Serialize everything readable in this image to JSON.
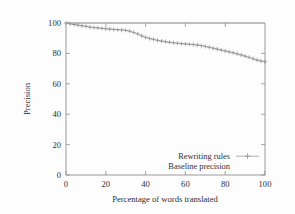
{
  "chart_data": {
    "type": "line",
    "title": "",
    "xlabel": "Percentage of words translated",
    "ylabel": "Precision",
    "xlim": [
      0,
      100
    ],
    "ylim": [
      0,
      100
    ],
    "xticks": [
      0,
      20,
      40,
      60,
      80,
      100
    ],
    "yticks": [
      0,
      20,
      40,
      60,
      80,
      100
    ],
    "grid": false,
    "legend_position": "inside-bottom-right",
    "legend": [
      "Rewriting rules",
      "Baseline precision"
    ],
    "series": [
      {
        "name": "Rewriting rules",
        "marker": "plus",
        "x": [
          0,
          2,
          4,
          6,
          8,
          10,
          12,
          14,
          16,
          18,
          20,
          22,
          24,
          26,
          28,
          30,
          32,
          34,
          36,
          38,
          40,
          42,
          44,
          46,
          48,
          50,
          52,
          54,
          56,
          58,
          60,
          62,
          64,
          66,
          68,
          70,
          72,
          74,
          76,
          78,
          80,
          82,
          84,
          86,
          88,
          90,
          92,
          94,
          96,
          98,
          100
        ],
        "values": [
          100,
          99.5,
          99,
          98.6,
          98.2,
          97.8,
          97.3,
          97,
          96.8,
          96.5,
          96.2,
          96,
          95.8,
          95.6,
          95.4,
          95.2,
          94.6,
          93.8,
          92.8,
          91.6,
          90.6,
          89.8,
          89.2,
          88.6,
          88.1,
          87.7,
          87.3,
          87,
          86.7,
          86.4,
          86.2,
          86,
          85.8,
          85.5,
          85.1,
          84.6,
          84,
          83.4,
          82.8,
          82.2,
          81.6,
          81,
          80.4,
          79.7,
          79,
          78.2,
          77.4,
          76.5,
          75.6,
          75,
          74.6
        ]
      },
      {
        "name": "Baseline precision",
        "marker": "none",
        "x": [
          0,
          100
        ],
        "values": [
          100,
          100
        ]
      }
    ]
  },
  "axes": {
    "x_tick_labels": [
      "0",
      "20",
      "40",
      "60",
      "80",
      "100"
    ],
    "y_tick_labels": [
      "0",
      "20",
      "40",
      "60",
      "80",
      "100"
    ],
    "x_axis_title": "Percentage of words translated",
    "y_axis_title": "Precision"
  },
  "legend_entries": [
    {
      "label": "Rewriting rules",
      "has_sample": true
    },
    {
      "label": "Baseline precision",
      "has_sample": false
    }
  ],
  "colors": {
    "series_line": "#9a9a9a",
    "baseline_line": "#a8a8a8",
    "axis": "#8f8f8f",
    "text": "#2e2e2e",
    "background": "#fdfdfd"
  }
}
